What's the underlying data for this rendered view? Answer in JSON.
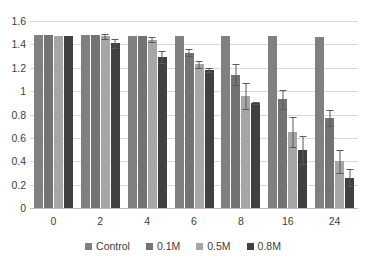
{
  "chart_data": {
    "type": "bar",
    "title": "",
    "subtitle": "",
    "xlabel": "",
    "ylabel": "",
    "categories": [
      "0",
      "2",
      "4",
      "6",
      "8",
      "16",
      "24"
    ],
    "ylim": [
      0,
      1.6
    ],
    "yticks": [
      "0",
      "0.2",
      "0.4",
      "0.6",
      "0.8",
      "1",
      "1.2",
      "1.4",
      "1.6"
    ],
    "ytick_values": [
      0,
      0.2,
      0.4,
      0.6,
      0.8,
      1,
      1.2,
      1.4,
      1.6
    ],
    "grid": true,
    "legend_position": "bottom",
    "series": [
      {
        "name": "Control",
        "color": "#808080",
        "values": [
          1.48,
          1.48,
          1.47,
          1.47,
          1.47,
          1.47,
          1.46
        ],
        "errors": [
          0,
          0,
          0,
          0,
          0,
          0,
          0
        ]
      },
      {
        "name": "0.1M",
        "color": "#737373",
        "values": [
          1.48,
          1.48,
          1.47,
          1.33,
          1.14,
          0.93,
          0.77
        ],
        "errors": [
          0,
          0,
          0,
          0.03,
          0.09,
          0.08,
          0.07
        ]
      },
      {
        "name": "0.5M",
        "color": "#a6a6a6",
        "values": [
          1.47,
          1.47,
          1.44,
          1.23,
          0.96,
          0.65,
          0.4
        ],
        "errors": [
          0,
          0.02,
          0.02,
          0.03,
          0.11,
          0.13,
          0.1
        ]
      },
      {
        "name": "0.8M",
        "color": "#404040",
        "values": [
          1.47,
          1.41,
          1.29,
          1.18,
          0.9,
          0.5,
          0.26
        ],
        "errors": [
          0,
          0.04,
          0.05,
          0.02,
          0.01,
          0.12,
          0.07
        ]
      }
    ]
  },
  "legend": {
    "items": [
      {
        "label": "Control",
        "color": "#808080"
      },
      {
        "label": "0.1M",
        "color": "#737373"
      },
      {
        "label": "0.5M",
        "color": "#a6a6a6"
      },
      {
        "label": "0.8M",
        "color": "#404040"
      }
    ]
  }
}
